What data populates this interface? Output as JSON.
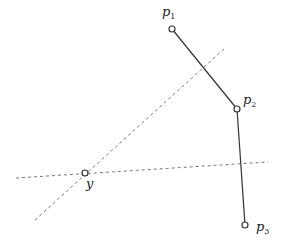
{
  "diagram": {
    "points": [
      {
        "id": "p1",
        "label": "p",
        "sub": "1",
        "x": 172,
        "y": 29,
        "lx": 162,
        "ly": 16
      },
      {
        "id": "p2",
        "label": "p",
        "sub": "2",
        "x": 237,
        "y": 109,
        "lx": 243,
        "ly": 104
      },
      {
        "id": "p3",
        "label": "p",
        "sub": "3",
        "x": 245,
        "y": 225,
        "lx": 256,
        "ly": 231
      }
    ],
    "query_point": {
      "id": "y",
      "label": "y",
      "x": 85,
      "y": 173,
      "lx": 86,
      "ly": 188
    },
    "polyline": [
      "p1",
      "p2",
      "p3"
    ],
    "dashed_lines": [
      {
        "x1": 16,
        "y1": 178,
        "x2": 268,
        "y2": 162
      },
      {
        "x1": 35,
        "y1": 220,
        "x2": 225,
        "y2": 48
      }
    ],
    "colors": {
      "solid": "#333333",
      "dashed": "#777777",
      "point_fill": "#ffffff"
    }
  }
}
